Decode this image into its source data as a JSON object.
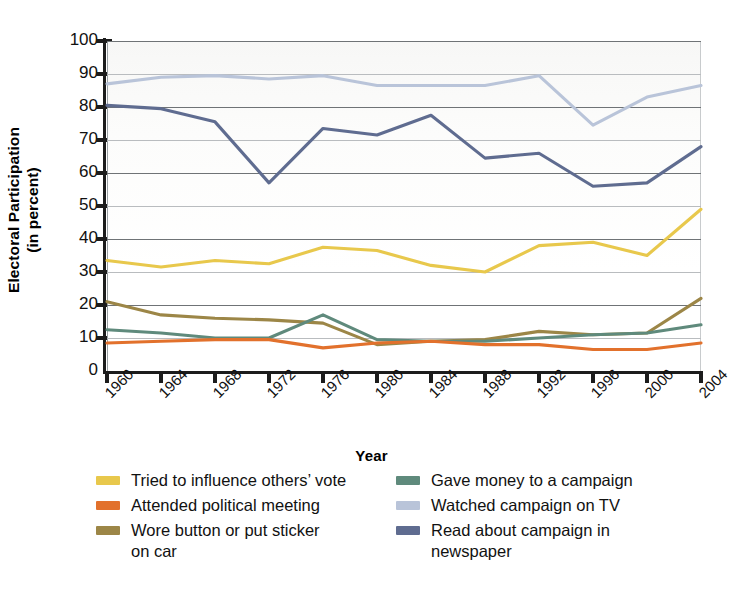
{
  "chart_data": {
    "type": "line",
    "title": "",
    "xlabel": "Year",
    "ylabel": "Electoral Participation (in percent)",
    "ylabel_line1": "Electoral Participation",
    "ylabel_line2": "(in percent)",
    "categories": [
      "1960",
      "1964",
      "1968",
      "1972",
      "1976",
      "1980",
      "1984",
      "1988",
      "1992",
      "1996",
      "2000",
      "2004"
    ],
    "ylim": [
      0,
      100
    ],
    "yticks": [
      0,
      10,
      20,
      30,
      40,
      50,
      60,
      70,
      80,
      90,
      100
    ],
    "grid": true,
    "legend_position": "bottom",
    "series": [
      {
        "name": "Tried to influence others’ vote",
        "color": "#e8c84c",
        "values": [
          33.5,
          31.5,
          33.5,
          32.5,
          37.5,
          36.5,
          32.0,
          30.0,
          38.0,
          39.0,
          35.0,
          49.0
        ]
      },
      {
        "name": "Attended political meeting",
        "color": "#e2712c",
        "values": [
          8.5,
          9.0,
          9.5,
          9.5,
          7.0,
          8.5,
          9.0,
          8.0,
          8.0,
          6.5,
          6.5,
          8.5
        ]
      },
      {
        "name": "Wore button or put sticker on car",
        "color": "#9c8647",
        "values": [
          21.0,
          17.0,
          16.0,
          15.5,
          14.5,
          8.0,
          9.0,
          9.5,
          12.0,
          11.0,
          11.5,
          22.0
        ]
      },
      {
        "name": "Gave money to a campaign",
        "color": "#5f8a7c",
        "values": [
          12.5,
          11.5,
          10.0,
          10.0,
          17.0,
          9.5,
          9.0,
          9.0,
          10.0,
          11.0,
          11.5,
          14.0
        ]
      },
      {
        "name": "Watched campaign on TV",
        "color": "#b9c4d9",
        "values": [
          87.0,
          89.0,
          89.5,
          88.5,
          89.5,
          86.5,
          86.5,
          86.5,
          89.5,
          74.5,
          83.0,
          86.5
        ]
      },
      {
        "name": "Read about campaign in newspaper",
        "color": "#5f6c90",
        "values": [
          80.5,
          79.5,
          75.5,
          57.0,
          73.5,
          71.5,
          77.5,
          64.5,
          66.0,
          56.0,
          57.0,
          68.0
        ]
      }
    ]
  },
  "legend": {
    "left": [
      {
        "label_line1": "Tried to influence others’ vote",
        "label_line2": "",
        "color": "#e8c84c",
        "icon": "legend-swatch-icon"
      },
      {
        "label_line1": "Attended political meeting",
        "label_line2": "",
        "color": "#e2712c",
        "icon": "legend-swatch-icon"
      },
      {
        "label_line1": "Wore button or put sticker",
        "label_line2": "on car",
        "color": "#9c8647",
        "icon": "legend-swatch-icon"
      }
    ],
    "right": [
      {
        "label_line1": "Gave money to a campaign",
        "label_line2": "",
        "color": "#5f8a7c",
        "icon": "legend-swatch-icon"
      },
      {
        "label_line1": "Watched campaign on TV",
        "label_line2": "",
        "color": "#b9c4d9",
        "icon": "legend-swatch-icon"
      },
      {
        "label_line1": "Read about campaign in",
        "label_line2": "newspaper",
        "color": "#5f6c90",
        "icon": "legend-swatch-icon"
      }
    ]
  }
}
